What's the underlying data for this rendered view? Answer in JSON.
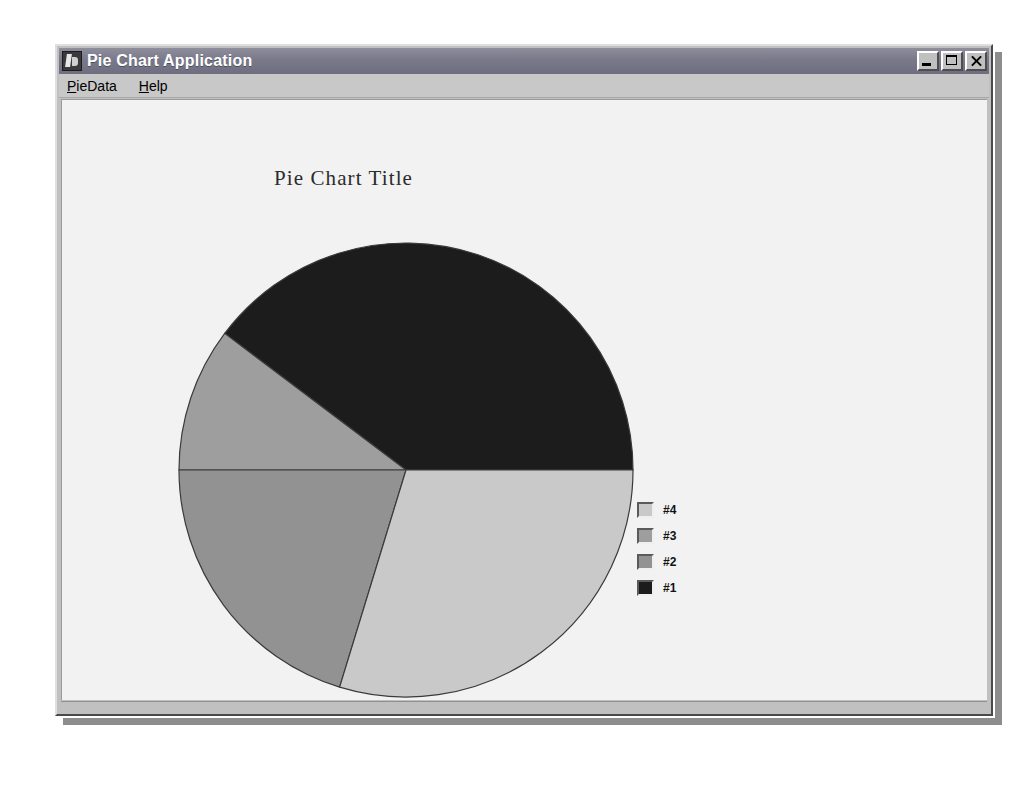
{
  "window": {
    "title": "Pie Chart Application",
    "icon": "app-icon",
    "buttons": {
      "minimize": "_",
      "maximize": "□",
      "close": "×"
    }
  },
  "menu": {
    "items": [
      {
        "label": "PieData",
        "mnemonic": "P",
        "rest": "ieData"
      },
      {
        "label": "Help",
        "mnemonic": "H",
        "rest": "elp"
      }
    ]
  },
  "chart_data": {
    "type": "pie",
    "title": "Pie Chart Title",
    "xlabel": "",
    "ylabel": "",
    "grid": false,
    "legend_position": "right",
    "start_angle_deg": 0,
    "direction": "counterclockwise",
    "labels": [
      "#1",
      "#2",
      "#3",
      "#4"
    ],
    "legend_order": [
      "#4",
      "#3",
      "#2",
      "#1"
    ],
    "values": [
      39.7,
      20.3,
      10.3,
      29.7
    ],
    "angles_deg": [
      143,
      73,
      37,
      107
    ],
    "colors": [
      "#1c1c1c",
      "#929292",
      "#9e9e9e",
      "#c9c9c9"
    ],
    "slices": [
      {
        "label": "#1",
        "value": 39.7,
        "angle_deg": 143,
        "color": "#1c1c1c",
        "start_deg": 0,
        "end_deg": 143
      },
      {
        "label": "#3",
        "value": 10.3,
        "angle_deg": 37,
        "color": "#9e9e9e",
        "start_deg": 143,
        "end_deg": 180
      },
      {
        "label": "#2",
        "value": 20.3,
        "angle_deg": 73,
        "color": "#929292",
        "start_deg": 180,
        "end_deg": 253
      },
      {
        "label": "#4",
        "value": 29.7,
        "angle_deg": 107,
        "color": "#c9c9c9",
        "start_deg": 253,
        "end_deg": 360
      }
    ]
  },
  "legend": {
    "entries": [
      {
        "label": "#4",
        "color": "#c9c9c9"
      },
      {
        "label": "#3",
        "color": "#9e9e9e"
      },
      {
        "label": "#2",
        "color": "#929292"
      },
      {
        "label": "#1",
        "color": "#1c1c1c"
      }
    ]
  },
  "colors": {
    "window_face": "#c0c0c0",
    "titlebar": "#79798a",
    "canvas": "#f2f2f2",
    "outline": "#3a3a3a"
  }
}
